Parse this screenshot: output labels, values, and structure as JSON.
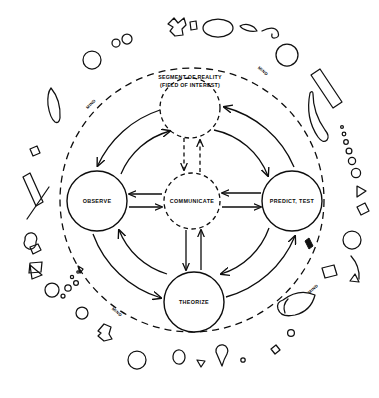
{
  "diagram": {
    "type": "cycle-diagram",
    "canvas": {
      "width": 379,
      "height": 398
    },
    "center_region": {
      "name": "segment-of-reality",
      "line1": "SEGMENT OF REALITY",
      "line2": "(FIELD OF INTEREST)",
      "shape": "dashed-circle",
      "cx": 190,
      "cy": 108,
      "r": 30
    },
    "nodes": [
      {
        "id": "observe",
        "label": "OBSERVE",
        "cx": 97,
        "cy": 201,
        "r": 30,
        "outline": "solid"
      },
      {
        "id": "communicate",
        "label": "COMMUNICATE",
        "cx": 192,
        "cy": 201,
        "r": 28,
        "outline": "dashed"
      },
      {
        "id": "predict",
        "label": "PREDICT, TEST",
        "cx": 292,
        "cy": 201,
        "r": 30,
        "outline": "solid"
      },
      {
        "id": "theorize",
        "label": "THEORIZE",
        "cx": 194,
        "cy": 302,
        "r": 30,
        "outline": "solid"
      }
    ],
    "boundary": {
      "name": "mind-boundary",
      "style": "dashed-circle",
      "cx": 192,
      "cy": 200,
      "r": 132,
      "labels": [
        {
          "text": "MIND",
          "x": 92,
          "y": 105,
          "rotate": -45
        },
        {
          "text": "MIND",
          "x": 262,
          "y": 72,
          "rotate": 40
        },
        {
          "text": "MIND",
          "x": 116,
          "y": 313,
          "rotate": 40
        },
        {
          "text": "MIND",
          "x": 314,
          "y": 290,
          "rotate": -42
        }
      ]
    },
    "rings": [
      {
        "name": "outer-arc-ring",
        "r": 104,
        "style": "solid-arcs"
      },
      {
        "name": "inner-arc-ring",
        "r": 74,
        "style": "solid-arcs"
      }
    ],
    "links": [
      {
        "from": "observe",
        "to": "communicate",
        "style": "solid",
        "direction": "bidirectional"
      },
      {
        "from": "communicate",
        "to": "predict",
        "style": "solid",
        "direction": "bidirectional"
      },
      {
        "from": "communicate",
        "to": "theorize",
        "style": "solid",
        "direction": "bidirectional"
      },
      {
        "from": "communicate",
        "to": "segment-of-reality",
        "style": "dashed",
        "direction": "bidirectional"
      },
      {
        "from": "segment-of-reality",
        "to": "observe",
        "style": "solid-arc",
        "direction": "outbound"
      },
      {
        "from": "predict",
        "to": "segment-of-reality",
        "style": "solid-arc",
        "direction": "inbound"
      },
      {
        "from": "observe",
        "to": "theorize",
        "style": "solid-arc",
        "direction": "outbound"
      },
      {
        "from": "theorize",
        "to": "predict",
        "style": "solid-arc",
        "direction": "outbound"
      }
    ],
    "decorations": {
      "name": "external-reality-shapes",
      "description": "scattered outline shapes surrounding the mind boundary"
    }
  }
}
